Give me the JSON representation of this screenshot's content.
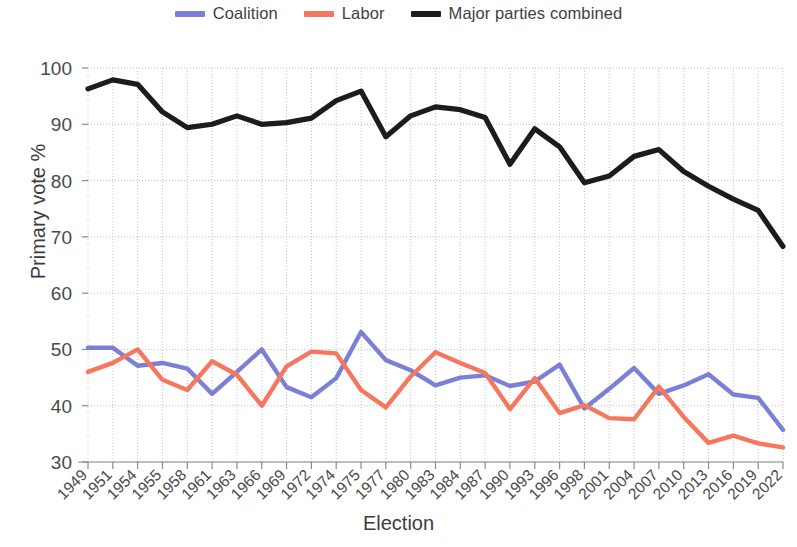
{
  "chart_data": {
    "type": "line",
    "title": "",
    "xlabel": "Election",
    "ylabel": "Primary vote %",
    "ylim": [
      30,
      100
    ],
    "yticks": [
      30,
      40,
      50,
      60,
      70,
      80,
      90,
      100
    ],
    "grid": true,
    "legend_position": "top-center",
    "categories": [
      "1949",
      "1951",
      "1954",
      "1955",
      "1958",
      "1961",
      "1963",
      "1966",
      "1969",
      "1972",
      "1974",
      "1975",
      "1977",
      "1980",
      "1983",
      "1984",
      "1987",
      "1990",
      "1993",
      "1996",
      "1998",
      "2001",
      "2004",
      "2007",
      "2010",
      "2013",
      "2016",
      "2019",
      "2022"
    ],
    "series": [
      {
        "name": "Coalition",
        "color": "#7b80d6",
        "values": [
          50.3,
          50.3,
          47.1,
          47.6,
          46.6,
          42.1,
          46.0,
          50.0,
          43.3,
          41.5,
          44.9,
          53.1,
          48.1,
          46.3,
          43.6,
          45.0,
          45.4,
          43.5,
          44.3,
          47.3,
          39.5,
          43.0,
          46.7,
          42.1,
          43.6,
          45.6,
          42.0,
          41.4,
          35.7
        ]
      },
      {
        "name": "Labor",
        "color": "#f4775e",
        "values": [
          46.0,
          47.6,
          50.0,
          44.6,
          42.8,
          47.9,
          45.5,
          40.0,
          47.0,
          49.6,
          49.3,
          42.8,
          39.7,
          45.2,
          49.5,
          47.6,
          45.8,
          39.4,
          44.9,
          38.7,
          40.1,
          37.8,
          37.6,
          43.4,
          38.0,
          33.4,
          34.7,
          33.3,
          32.6
        ]
      },
      {
        "name": "Major parties combined",
        "color": "#1c1c1c",
        "values": [
          96.3,
          97.9,
          97.1,
          92.2,
          89.4,
          90.0,
          91.5,
          90.0,
          90.3,
          91.1,
          94.2,
          95.9,
          87.8,
          91.5,
          93.1,
          92.6,
          91.2,
          82.9,
          89.2,
          86.0,
          79.6,
          80.8,
          84.3,
          85.5,
          81.6,
          79.0,
          76.7,
          74.7,
          68.3
        ]
      }
    ]
  },
  "legend": {
    "items": [
      {
        "label": "Coalition",
        "color": "#7b80d6"
      },
      {
        "label": "Labor",
        "color": "#f4775e"
      },
      {
        "label": "Major parties combined",
        "color": "#1c1c1c"
      }
    ]
  },
  "axes": {
    "y_title": "Primary vote %",
    "x_title": "Election"
  }
}
